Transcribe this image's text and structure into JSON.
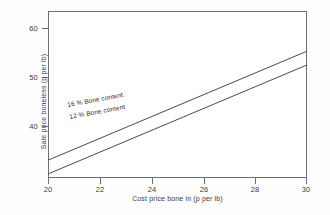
{
  "chart_data": {
    "type": "line",
    "title": "",
    "xlabel": "Cost price bone in (p per lb)",
    "ylabel": "Sale price boneless (p per lb)",
    "xlim": [
      20,
      30
    ],
    "ylim": [
      33.3,
      62.4
    ],
    "xticks": [
      20,
      22,
      24,
      26,
      28,
      30
    ],
    "yticks": [
      40,
      50,
      60
    ],
    "xtick_labels": [
      "20",
      "22",
      "24",
      "26",
      "28",
      "30"
    ],
    "ytick_labels": [
      "40",
      "50",
      "60"
    ],
    "grid": false,
    "legend": "inline-annotations",
    "series": [
      {
        "name": "16 % Bone content",
        "label": "16 % Bone content",
        "color": "#4a4a4a",
        "x": [
          20,
          30
        ],
        "values": [
          36.4,
          55.4
        ]
      },
      {
        "name": "12 % Bone content",
        "label": "12 % Bone content",
        "color": "#4a4a4a",
        "x": [
          20,
          30
        ],
        "values": [
          34.0,
          53.0
        ]
      }
    ],
    "annotations": [
      {
        "text": "16 % Bone content",
        "series": "16 % Bone content"
      },
      {
        "text": "12 % Bone content",
        "series": "12 % Bone content"
      }
    ]
  },
  "axes": {
    "frame_color": "#6e6e6e",
    "tick_color": "#6e6e6e",
    "label_color": "#3a3a3a"
  }
}
